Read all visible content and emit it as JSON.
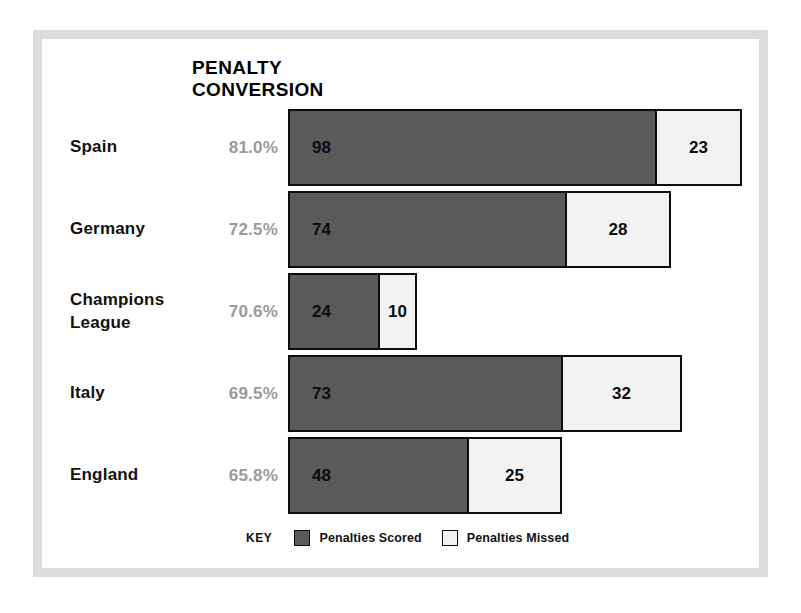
{
  "chart_data": {
    "type": "bar",
    "subtype": "stacked-horizontal",
    "title": "PENALTY CONVERSION",
    "title_lines": [
      "PENALTY",
      "CONVERSION"
    ],
    "categories": [
      "Spain",
      "Germany",
      "Champions League",
      "Italy",
      "England"
    ],
    "series": [
      {
        "name": "Penalties Scored",
        "values": [
          98,
          74,
          24,
          73,
          48
        ],
        "color": "#5a5a5a"
      },
      {
        "name": "Penalties Missed",
        "values": [
          23,
          28,
          10,
          32,
          25
        ],
        "color": "#f2f2f2"
      }
    ],
    "annotations": {
      "conversion_rate": [
        "81.0%",
        "72.5%",
        "70.6%",
        "69.5%",
        "65.8%"
      ]
    },
    "grid": false,
    "legend_position": "bottom",
    "xlabel": "",
    "ylabel": "",
    "px_per_unit": 3.77
  },
  "rows": [
    {
      "label_lines": [
        "Spain"
      ],
      "percent": "81.0%",
      "scored": 98,
      "missed": 23,
      "scored_label": "98",
      "missed_label": "23",
      "scored_px": 369,
      "missed_px": 87
    },
    {
      "label_lines": [
        "Germany"
      ],
      "percent": "72.5%",
      "scored": 74,
      "missed": 28,
      "scored_label": "74",
      "missed_label": "28",
      "scored_px": 279,
      "missed_px": 106
    },
    {
      "label_lines": [
        "Champions",
        "League"
      ],
      "percent": "70.6%",
      "scored": 24,
      "missed": 10,
      "scored_label": "24",
      "missed_label": "10",
      "scored_px": 92,
      "missed_px": 39
    },
    {
      "label_lines": [
        "Italy"
      ],
      "percent": "69.5%",
      "scored": 73,
      "missed": 32,
      "scored_label": "73",
      "missed_label": "32",
      "scored_px": 275,
      "missed_px": 121
    },
    {
      "label_lines": [
        "England"
      ],
      "percent": "65.8%",
      "scored": 48,
      "missed": 25,
      "scored_label": "48",
      "missed_label": "25",
      "scored_px": 181,
      "missed_px": 95
    }
  ],
  "legend": {
    "key_label": "KEY",
    "items": [
      {
        "label": "Penalties Scored",
        "color": "#5a5a5a"
      },
      {
        "label": "Penalties Missed",
        "color": "#f2f2f2"
      }
    ]
  },
  "colors": {
    "scored": "#5a5a5a",
    "missed": "#f2f2f2",
    "border": "#0d0d0d",
    "percent_text": "#9a9a9a",
    "label_text": "#111111",
    "frame": "#dcdcdc",
    "background": "#ffffff"
  }
}
